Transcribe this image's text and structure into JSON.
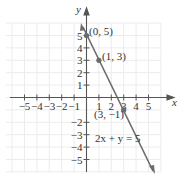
{
  "chart_data": {
    "type": "line",
    "title": "",
    "xlabel": "x",
    "ylabel": "y",
    "xlim": [
      -5,
      5
    ],
    "ylim": [
      -5,
      5
    ],
    "grid": true,
    "x_ticks": [
      "-5",
      "-4",
      "-3",
      "-2",
      "-1",
      "1",
      "2",
      "3",
      "4",
      "5"
    ],
    "y_ticks": [
      "5",
      "4",
      "3",
      "2",
      "1",
      "-2",
      "-3",
      "-4",
      "-5"
    ],
    "series": [
      {
        "name": "2x + y = 5",
        "equation": "2x + y = 5",
        "slope": -2,
        "intercept": 5,
        "color": "#6b6b6b"
      }
    ],
    "points": [
      {
        "x": 0,
        "y": 5,
        "label": "(0, 5)"
      },
      {
        "x": 1,
        "y": 3,
        "label": "(1, 3)"
      },
      {
        "x": 3,
        "y": -1,
        "label": "(3, −1)"
      }
    ],
    "annotations": [
      {
        "text": "2x + y = 5",
        "x": 1.1,
        "y": -3.2
      }
    ]
  },
  "labels": {
    "x_axis": "x",
    "y_axis": "y",
    "equation": "2x + y = 5",
    "p1": "(0, 5)",
    "p2": "(1, 3)",
    "p3": "(3, −1)",
    "xt": [
      "−5",
      "−4",
      "−3",
      "−2",
      "−1",
      "1",
      "2",
      "3",
      "4",
      "5"
    ],
    "yt": [
      "5",
      "4",
      "3",
      "2",
      "1",
      "−2",
      "−3",
      "−4",
      "−5"
    ]
  },
  "colors": {
    "axis": "#555555",
    "grid": "#e6e6e6",
    "line": "#6b6b6b",
    "point": "#6b6b6b"
  }
}
